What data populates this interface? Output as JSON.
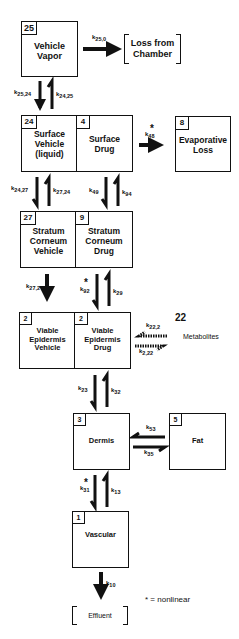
{
  "diagram": {
    "compartments": {
      "vehicle_vapor": {
        "number": "25",
        "line1": "Vehicle",
        "line2": "Vapor"
      },
      "surface_vehicle": {
        "number": "24",
        "line1": "Surface",
        "line2": "Vehicle",
        "line3": "(liquid)"
      },
      "surface_drug": {
        "number": "4",
        "line1": "Surface",
        "line2": "Drug"
      },
      "evaporative_loss": {
        "number": "8",
        "line1": "Evaporative",
        "line2": "Loss"
      },
      "sc_vehicle": {
        "number": "27",
        "line1": "Stratum",
        "line2": "Corneum",
        "line3": "Vehicle"
      },
      "sc_drug": {
        "number": "9",
        "line1": "Stratum",
        "line2": "Corneum",
        "line3": "Drug"
      },
      "ve_vehicle": {
        "number": "2",
        "line1": "Viable",
        "line2": "Epidermis",
        "line3": "Vehicle"
      },
      "ve_drug": {
        "number": "2",
        "line1": "Viable",
        "line2": "Epidermis",
        "line3": "Drug"
      },
      "dermis": {
        "number": "3",
        "line1": "Dermis"
      },
      "fat": {
        "number": "5",
        "line1": "Fat"
      },
      "vascular": {
        "number": "1",
        "line1": "Vascular"
      }
    },
    "sinks": {
      "loss_from_chamber": {
        "line1": "Loss from",
        "line2": "Chamber"
      },
      "effluent": {
        "line1": "Effluent"
      }
    },
    "metabolites": {
      "number": "22",
      "label": "Metabolites"
    },
    "rate_constants": {
      "k25_0": {
        "k": "k",
        "sub": "25,0"
      },
      "k25_24": {
        "k": "k",
        "sub": "25,24"
      },
      "k24_25": {
        "k": "k",
        "sub": "24,25"
      },
      "k48": {
        "k": "k",
        "sub": "48",
        "nonlinear": "*"
      },
      "k24_27": {
        "k": "k",
        "sub": "24,27"
      },
      "k27_24": {
        "k": "k",
        "sub": "27,24"
      },
      "k49": {
        "k": "k",
        "sub": "49"
      },
      "k94": {
        "k": "k",
        "sub": "94"
      },
      "k27_2": {
        "k": "k",
        "sub": "27,2"
      },
      "k92": {
        "k": "k",
        "sub": "92",
        "nonlinear": "*"
      },
      "k29": {
        "k": "k",
        "sub": "29"
      },
      "k22_2": {
        "k": "k",
        "sub": "22,2"
      },
      "k2_22": {
        "k": "k",
        "sub": "2,22"
      },
      "k23": {
        "k": "k",
        "sub": "23"
      },
      "k32": {
        "k": "k",
        "sub": "32"
      },
      "k53": {
        "k": "k",
        "sub": "53"
      },
      "k35": {
        "k": "k",
        "sub": "35"
      },
      "k31": {
        "k": "k",
        "sub": "31",
        "nonlinear": "*"
      },
      "k13": {
        "k": "k",
        "sub": "13"
      },
      "k10": {
        "k": "k",
        "sub": "10"
      }
    },
    "legend": "* = nonlinear"
  }
}
